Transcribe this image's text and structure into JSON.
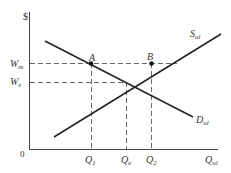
{
  "diagram": {
    "type": "supply-demand",
    "y_axis_label": "$",
    "x_axis_label": "Q",
    "x_axis_sub": "ul",
    "origin_label": "0",
    "supply": {
      "label": "S",
      "sub": "ul"
    },
    "demand": {
      "label": "D",
      "sub": "ul"
    },
    "points": [
      {
        "label": "A"
      },
      {
        "label": "B"
      }
    ],
    "y_ticks": [
      {
        "label": "W",
        "sub": "m"
      },
      {
        "label": "W",
        "sub": "e"
      }
    ],
    "x_ticks": [
      {
        "label": "Q",
        "sub": "1"
      },
      {
        "label": "Q",
        "sub": "e"
      },
      {
        "label": "Q",
        "sub": "2"
      }
    ]
  }
}
